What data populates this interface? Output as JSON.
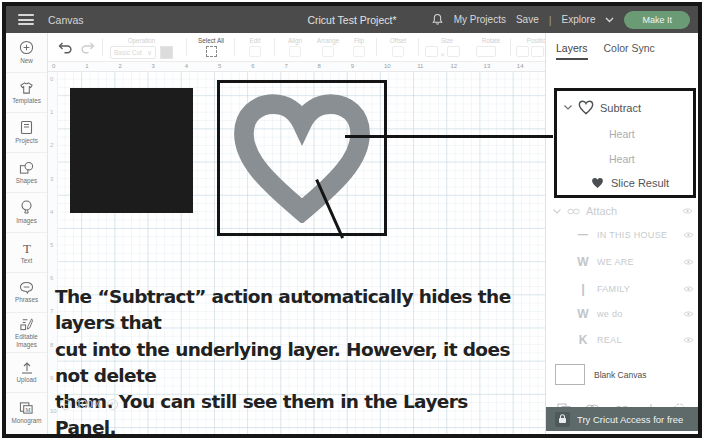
{
  "header": {
    "canvas_label": "Canvas",
    "title": "Cricut Test Project*",
    "my_projects_label": "My Projects",
    "save_label": "Save",
    "divider": "|",
    "explore_label": "Explore",
    "make_it_label": "Make It"
  },
  "sidebar": {
    "items": [
      {
        "label": "New",
        "icon": "plus-circle-icon"
      },
      {
        "label": "Templates",
        "icon": "shirt-icon"
      },
      {
        "label": "Projects",
        "icon": "notebook-icon"
      },
      {
        "label": "Shapes",
        "icon": "shapes-icon"
      },
      {
        "label": "Images",
        "icon": "balloon-icon"
      },
      {
        "label": "Text",
        "icon": "letter-t-icon"
      },
      {
        "label": "Phrases",
        "icon": "speech-bubble-icon"
      },
      {
        "label": "Editable Images",
        "icon": "editable-image-icon"
      },
      {
        "label": "Upload",
        "icon": "upload-arrow-icon"
      },
      {
        "label": "Monogram",
        "icon": "monogram-icon"
      }
    ]
  },
  "toolbar": {
    "operation_label": "Operation",
    "operation_value": "Basic Cut",
    "select_all_label": "Select All",
    "group_labels": [
      "Edit",
      "Align",
      "Arrange",
      "Flip",
      "Offset"
    ],
    "size_label": "Size",
    "rotate_label": "Rotate",
    "position_label": "Position"
  },
  "ruler": {
    "top_numbers": [
      "0",
      "1",
      "2",
      "3",
      "4",
      "5",
      "6",
      "7",
      "8",
      "9",
      "10",
      "11",
      "12",
      "13",
      "14"
    ],
    "left_numbers": [
      "0",
      "1",
      "2",
      "3",
      "4",
      "5",
      "6",
      "7",
      "8",
      "9",
      "10"
    ]
  },
  "canvas": {
    "zoom_value": "100%"
  },
  "annotation": {
    "lines": [
      "The “Subtract” action automatically hides the layers that",
      "cut into the underlying layer. However, it does not delete",
      "them. You can still see them in the Layers Panel."
    ]
  },
  "layers_panel": {
    "tabs": [
      {
        "label": "Layers"
      },
      {
        "label": "Color Sync"
      }
    ],
    "subtract_group": {
      "label": "Subtract",
      "children": [
        "Heart",
        "Heart"
      ],
      "result_label": "Slice Result"
    },
    "attach_group": {
      "label": "Attach",
      "items": [
        {
          "glyph": "—",
          "label": "IN THIS HOUSE"
        },
        {
          "glyph": "W",
          "label": "WE ARE"
        },
        {
          "glyph": "|",
          "label": "FAMILY"
        },
        {
          "glyph": "W",
          "label": "we do"
        },
        {
          "glyph": "K",
          "label": "REAL"
        }
      ]
    },
    "blank_canvas_label": "Blank Canvas",
    "actions": [
      {
        "label": "Slice"
      },
      {
        "label": "Combine"
      },
      {
        "label": "Attach"
      },
      {
        "label": "Flatten"
      },
      {
        "label": "Contour"
      }
    ],
    "access_banner": "Try Cricut Access for free"
  },
  "colors": {
    "header_bg": "#4b4b4b",
    "make_it_green": "#6b9b74",
    "banner_bg": "#5e6a6a",
    "heart_gray": "#8a8f93",
    "square_black": "#1c1c1c",
    "annotation_border": "#141414"
  }
}
